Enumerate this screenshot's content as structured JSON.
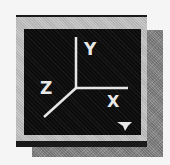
{
  "widget": {
    "type": "axis-orientation-button",
    "colors": {
      "background": "#f5f5f5",
      "frame_dark": "#1a1a1a",
      "bevel_light": "#c8c8c8",
      "viewport": "#0c0c0c",
      "axis_line": "#e8e8e8",
      "shadow": "#8a8a8a"
    },
    "axes": {
      "y_label": "Y",
      "z_label": "Z",
      "x_label": "X"
    },
    "icons": {
      "dropdown": "triangle-down-icon"
    }
  }
}
